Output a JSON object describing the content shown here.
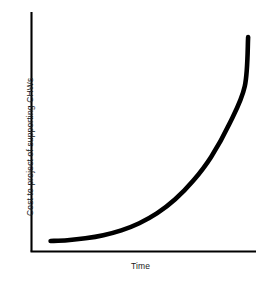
{
  "figure": {
    "background_color": "#ffffff",
    "ink_color": "#000000",
    "text_color": "#1a1a1a"
  },
  "chart_data": {
    "type": "line",
    "title": "",
    "subtitle": "",
    "xlabel": "Time",
    "ylabel": "Cost to project of supporting CHWs",
    "grid": false,
    "legend": null,
    "x_tick_labels": [],
    "y_tick_labels": [],
    "xlim": [
      0,
      10
    ],
    "ylim": [
      0,
      10
    ],
    "annotations": [],
    "series": [
      {
        "name": "Cost to project of supporting CHWs",
        "style": "smooth-exponential",
        "line_color": "#000000",
        "line_width": 4.6,
        "x": [
          0.85,
          1.6,
          2.4,
          3.2,
          4.0,
          4.8,
          5.6,
          6.4,
          7.2,
          8.0,
          8.8,
          9.5,
          9.65
        ],
        "y": [
          0.44,
          0.47,
          0.55,
          0.68,
          0.88,
          1.18,
          1.6,
          2.18,
          2.95,
          3.95,
          5.3,
          6.9,
          8.95
        ]
      }
    ]
  },
  "axes": {
    "x_axis_label": "Time",
    "y_axis_label": "Cost to project of supporting CHWs"
  }
}
